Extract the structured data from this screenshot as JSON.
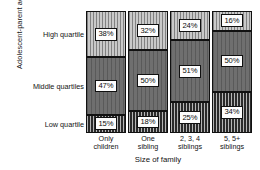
{
  "chart_data": {
    "type": "bar",
    "subtype": "stacked-100-percent",
    "title": "",
    "xlabel": "Size of family",
    "ylabel": "Adolescent-parent adjustment",
    "categories": [
      "Only children",
      "One sibling",
      "2, 3, 4 siblings",
      "5, 5+ siblings"
    ],
    "category_lines": [
      [
        "Only",
        "children"
      ],
      [
        "One",
        "sibling"
      ],
      [
        "2, 3, 4",
        "siblings"
      ],
      [
        "5, 5+",
        "siblings"
      ]
    ],
    "series": [
      {
        "name": "High quartile",
        "values": [
          38,
          32,
          24,
          16
        ],
        "labels": [
          "38%",
          "32%",
          "24%",
          "16%"
        ],
        "fill": "light-vertical-hatch",
        "color": "#c9c9c9"
      },
      {
        "name": "Middle quartiles",
        "values": [
          47,
          50,
          51,
          50
        ],
        "labels": [
          "47%",
          "50%",
          "51%",
          "50%"
        ],
        "fill": "solid-gray",
        "color": "#6f6f6f"
      },
      {
        "name": "Low quartile",
        "values": [
          15,
          18,
          25,
          34
        ],
        "labels": [
          "15%",
          "18%",
          "25%",
          "34%"
        ],
        "fill": "dark-vertical-hatch",
        "color": "#2a2a2a"
      }
    ],
    "row_labels": [
      "High quartile",
      "Middle quartiles",
      "Low quartile"
    ],
    "ylim": [
      0,
      100
    ],
    "grid": false,
    "legend": "none",
    "value_suffix": "%"
  }
}
